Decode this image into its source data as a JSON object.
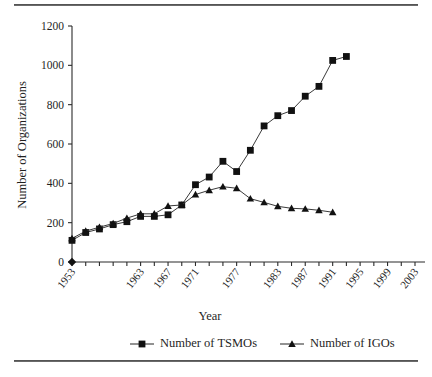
{
  "chart_data": {
    "type": "line",
    "title": "",
    "xlabel": "Year",
    "ylabel": "Number of Organizations",
    "xlim": [
      1953,
      2003
    ],
    "ylim": [
      0,
      1200
    ],
    "yticks": [
      0,
      200,
      400,
      600,
      800,
      1000,
      1200
    ],
    "ytick_labels": [
      "0",
      "200",
      "400",
      "600",
      "800",
      "1000",
      "1200"
    ],
    "x": [
      1953,
      1955,
      1957,
      1959,
      1961,
      1963,
      1965,
      1967,
      1969,
      1971,
      1973,
      1975,
      1977,
      1979,
      1981,
      1983,
      1985,
      1987,
      1989,
      1991,
      1993,
      1995,
      1997,
      1999,
      2001,
      2003
    ],
    "xtick_labels": [
      "1953",
      "1963",
      "1967",
      "1971",
      "1977",
      "1983",
      "1987",
      "1991",
      "1995",
      "1999",
      "2003"
    ],
    "xtick_values": [
      1953,
      1963,
      1967,
      1971,
      1977,
      1983,
      1987,
      1991,
      1995,
      1999,
      2003
    ],
    "grid": false,
    "legend_position": "bottom",
    "series": [
      {
        "name": "Number of TSMOs",
        "marker": "square",
        "color": "#111111",
        "values": [
          110,
          150,
          168,
          190,
          205,
          232,
          232,
          240,
          290,
          393,
          432,
          512,
          460,
          568,
          692,
          744,
          770,
          843,
          893,
          1025,
          1045,
          null,
          null,
          null,
          null,
          null
        ]
      },
      {
        "name": "Number of IGOs",
        "marker": "triangle",
        "color": "#111111",
        "values": [
          120,
          157,
          177,
          196,
          223,
          245,
          245,
          285,
          290,
          343,
          365,
          383,
          375,
          322,
          303,
          283,
          273,
          270,
          263,
          253,
          null,
          null,
          null,
          null,
          null,
          null
        ]
      }
    ],
    "tsmo_points": [
      {
        "year": 1953,
        "value": 110
      },
      {
        "year": 1955,
        "value": 150
      },
      {
        "year": 1957,
        "value": 168
      },
      {
        "year": 1959,
        "value": 190
      },
      {
        "year": 1961,
        "value": 205
      },
      {
        "year": 1963,
        "value": 232
      },
      {
        "year": 1965,
        "value": 232
      },
      {
        "year": 1967,
        "value": 240
      },
      {
        "year": 1969,
        "value": 290
      },
      {
        "year": 1971,
        "value": 393
      },
      {
        "year": 1973,
        "value": 432
      },
      {
        "year": 1975,
        "value": 512
      },
      {
        "year": 1977,
        "value": 460
      },
      {
        "year": 1979,
        "value": 568
      },
      {
        "year": 1981,
        "value": 692
      },
      {
        "year": 1983,
        "value": 744
      },
      {
        "year": 1985,
        "value": 770
      },
      {
        "year": 1987,
        "value": 843
      },
      {
        "year": 1989,
        "value": 893
      },
      {
        "year": 1991,
        "value": 1025
      },
      {
        "year": 1993,
        "value": 1045
      }
    ],
    "igo_points": [
      {
        "year": 1953,
        "value": 120
      },
      {
        "year": 1955,
        "value": 157
      },
      {
        "year": 1957,
        "value": 177
      },
      {
        "year": 1959,
        "value": 196
      },
      {
        "year": 1961,
        "value": 223
      },
      {
        "year": 1963,
        "value": 245
      },
      {
        "year": 1965,
        "value": 245
      },
      {
        "year": 1967,
        "value": 285
      },
      {
        "year": 1969,
        "value": 290
      },
      {
        "year": 1971,
        "value": 343
      },
      {
        "year": 1973,
        "value": 365
      },
      {
        "year": 1975,
        "value": 383
      },
      {
        "year": 1977,
        "value": 375
      },
      {
        "year": 1979,
        "value": 322
      },
      {
        "year": 1981,
        "value": 303
      },
      {
        "year": 1983,
        "value": 283
      },
      {
        "year": 1985,
        "value": 273
      },
      {
        "year": 1987,
        "value": 270
      },
      {
        "year": 1989,
        "value": 263
      },
      {
        "year": 1991,
        "value": 253
      }
    ],
    "origin_marker": {
      "year": 1953,
      "value": 0,
      "marker": "diamond"
    }
  },
  "legend": {
    "items": [
      {
        "label": "Number of TSMOs",
        "marker": "square"
      },
      {
        "label": "Number of IGOs",
        "marker": "triangle"
      }
    ]
  },
  "axes": {
    "y_title": "Number of Organizations",
    "x_title": "Year"
  }
}
